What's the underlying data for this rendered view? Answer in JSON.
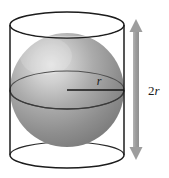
{
  "figure": {
    "type": "geometry-diagram",
    "canvas": {
      "width": 169,
      "height": 178,
      "background": "#ffffff"
    },
    "labels": {
      "radius": "r",
      "height_number": "2",
      "height_variable": "r",
      "height_full": "2r"
    },
    "shapes": {
      "cylinder": {
        "name": "cylinder",
        "outline_color": "#1c1c1c",
        "stroke_width": 1.4,
        "center_x": 67,
        "radius_x": 57,
        "ellipse_ry": 13,
        "top_y": 25,
        "bottom_y": 155,
        "left_wall_x": 10,
        "right_wall_x": 124
      },
      "sphere": {
        "name": "sphere",
        "center_x": 67,
        "center_y": 90,
        "radius": 57,
        "fill_light": "#d8d8d8",
        "fill_mid": "#9a9a9a",
        "fill_dark": "#6e6e6e",
        "highlight_x": 44,
        "highlight_y": 58
      },
      "equator": {
        "name": "equator-ellipse",
        "center_x": 67,
        "center_y": 90,
        "radius_x": 57,
        "radius_y": 19,
        "stroke_color": "#4a4a4a",
        "stroke_width": 1.1
      },
      "radius_line": {
        "name": "radius-line",
        "x1": 67,
        "y1": 90,
        "x2": 124,
        "y2": 90,
        "stroke_color": "#1a1a1a",
        "stroke_width": 1.3,
        "label_x": 99,
        "label_y": 84
      },
      "dimension_arrow": {
        "name": "height-dimension-arrow",
        "x": 136,
        "top_y": 21,
        "bottom_y": 158,
        "color": "#9d9d9d",
        "shaft_width": 6,
        "head_width": 13,
        "head_height": 12,
        "label_x": 150,
        "label_y": 94
      }
    }
  }
}
